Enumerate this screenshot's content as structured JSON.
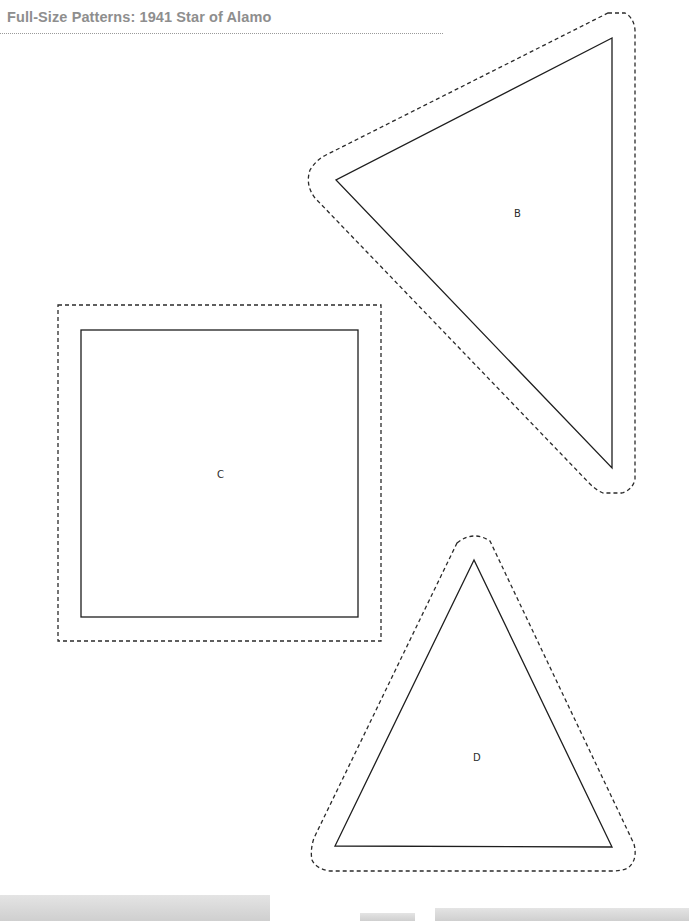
{
  "header": {
    "title": "Full-Size Patterns: 1941 Star of Alamo"
  },
  "pieces": [
    {
      "id": "B",
      "label": "B",
      "shape": "triangle"
    },
    {
      "id": "C",
      "label": "C",
      "shape": "square"
    },
    {
      "id": "D",
      "label": "D",
      "shape": "triangle"
    }
  ],
  "legend": {
    "solid_line": "cutting line",
    "dashed_line": "seam allowance"
  }
}
